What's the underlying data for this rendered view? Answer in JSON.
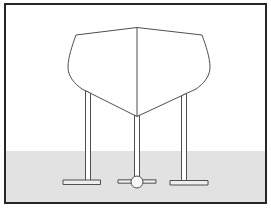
{
  "figure": {
    "paths": {
      "ground": "M5,151 H266.5 V203 H5 Z",
      "hull": "M76,35 L137,27.5 L202,35 C206,46 210,58 210,67 C210,77 203,84 196,89 L137,116.5 L82,89 C75,84 68,77 68,67 C68,58 72,46 76,35 Z",
      "stem_line": "M137,27.5 L137,116.5",
      "left_post": "M85.5,90.7 L90.5,93.3 L90.5,180.5 L85.5,180.5 Z",
      "right_post": "M181.5,95.8 L186.5,93.4 L186.5,181 L181.5,181 Z",
      "keel_post": "M134.5,115.3 L137,116.5 L139.5,115.3 L139.5,176.5 L134.5,176.5 Z",
      "left_base_plate": "M63,180 H100.5 V184.5 H63 Z",
      "right_base_plate": "M170,180.5 H208 V185 H170 Z",
      "roller_arm_left": "M118,179.8 H131.5 V183.2 H118 Z",
      "roller_arm_right": "M142.5,179.8 H156 V183.2 H142.5 Z",
      "roller": "M131,182 a6,6 0 1 0 12,0 a6,6 0 1 0 -12,0 Z",
      "frame": "M5,4 H266 V203 H5 Z"
    }
  },
  "colors": {
    "background": "#ffffff",
    "frame_border": "#262626",
    "line": "#4f4f4f",
    "hull_fill": "#ffffff",
    "ground": "#e2e2e2",
    "plate_fill": "#ededed",
    "post_fill": "#ffffff",
    "roller_fill": "#fafafa"
  }
}
